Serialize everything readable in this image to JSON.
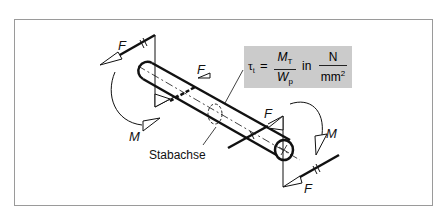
{
  "diagram": {
    "type": "torsion-of-shaft",
    "labels": {
      "force": "F",
      "moment": "M",
      "axis": "Stabachse"
    },
    "formula": {
      "lhs_symbol": "τ",
      "lhs_sub": "t",
      "equals": "=",
      "numerator": "M",
      "numerator_sub": "T",
      "denominator": "W",
      "denominator_sub": "p",
      "in_word": "in",
      "unit_numerator": "N",
      "unit_denominator": "mm",
      "unit_denominator_sup": "2"
    },
    "colors": {
      "formula_background": "#cbcbcb",
      "stroke": "#111111",
      "frame_border": "#9a9a9a"
    }
  }
}
